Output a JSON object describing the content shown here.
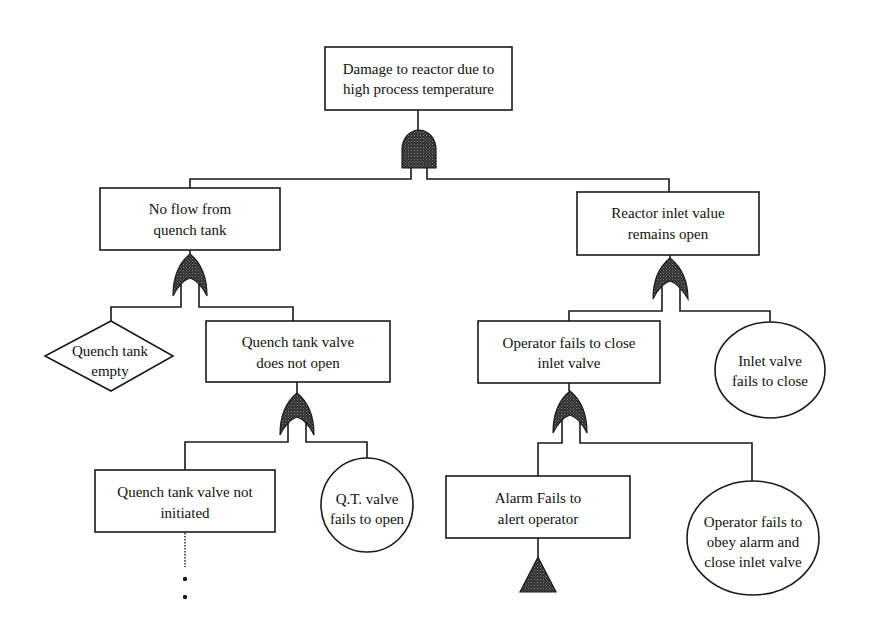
{
  "diagram": {
    "type": "fault-tree",
    "colors": {
      "line": "#1a1a1a",
      "gate_fill": "#333333",
      "background": "#ffffff"
    },
    "top_event": {
      "id": "top",
      "shape": "rectangle",
      "lines": [
        "Damage to reactor due to",
        "high process temperature"
      ],
      "gate": "AND"
    },
    "events": {
      "no_flow": {
        "shape": "rectangle",
        "lines": [
          "No flow from",
          "quench tank"
        ],
        "gate": "OR"
      },
      "reactor_inlet": {
        "shape": "rectangle",
        "lines": [
          "Reactor inlet value",
          "remains open"
        ],
        "gate": "OR"
      },
      "quench_empty": {
        "shape": "diamond",
        "symbol": "undeveloped-event",
        "lines": [
          "Quench tank",
          "empty"
        ]
      },
      "qt_valve_not_open": {
        "shape": "rectangle",
        "lines": [
          "Quench tank valve",
          "does not open"
        ],
        "gate": "OR"
      },
      "qt_valve_not_initiated": {
        "shape": "rectangle",
        "lines": [
          "Quench tank valve not",
          "initiated"
        ],
        "continuation": "dotted-ellipsis"
      },
      "qt_valve_fails": {
        "shape": "circle",
        "symbol": "basic-event",
        "lines": [
          "Q.T. valve",
          "fails to open"
        ]
      },
      "operator_fails_close": {
        "shape": "rectangle",
        "lines": [
          "Operator fails to close",
          "inlet valve"
        ],
        "gate": "OR"
      },
      "inlet_valve_fails": {
        "shape": "circle",
        "symbol": "basic-event",
        "lines": [
          "Inlet valve",
          "fails to close"
        ]
      },
      "alarm_fails": {
        "shape": "rectangle",
        "lines": [
          "Alarm Fails to",
          "alert operator"
        ],
        "transfer": "triangle"
      },
      "operator_fails_obey": {
        "shape": "circle",
        "symbol": "basic-event",
        "lines": [
          "Operator fails to",
          "obey alarm and",
          "close inlet valve"
        ]
      }
    },
    "edges": [
      {
        "from": "top",
        "to": "no_flow",
        "via": "AND"
      },
      {
        "from": "top",
        "to": "reactor_inlet",
        "via": "AND"
      },
      {
        "from": "no_flow",
        "to": "quench_empty",
        "via": "OR"
      },
      {
        "from": "no_flow",
        "to": "qt_valve_not_open",
        "via": "OR"
      },
      {
        "from": "qt_valve_not_open",
        "to": "qt_valve_not_initiated",
        "via": "OR"
      },
      {
        "from": "qt_valve_not_open",
        "to": "qt_valve_fails",
        "via": "OR"
      },
      {
        "from": "reactor_inlet",
        "to": "operator_fails_close",
        "via": "OR"
      },
      {
        "from": "reactor_inlet",
        "to": "inlet_valve_fails",
        "via": "OR"
      },
      {
        "from": "operator_fails_close",
        "to": "alarm_fails",
        "via": "OR"
      },
      {
        "from": "operator_fails_close",
        "to": "operator_fails_obey",
        "via": "OR"
      }
    ]
  }
}
